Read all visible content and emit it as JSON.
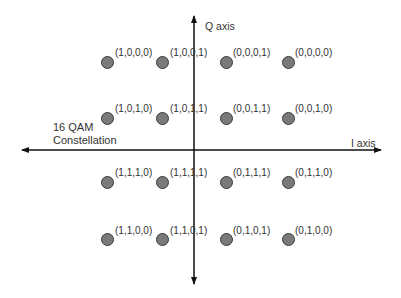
{
  "diagram": {
    "title_line1": "16 QAM",
    "title_line2": "Constellation",
    "q_axis_label": "Q axis",
    "i_axis_label": "I axis",
    "colors": {
      "dot_fill": "#7a7a7a",
      "dot_stroke": "#3a3a3a",
      "axis": "#111111"
    },
    "points": [
      {
        "row": 0,
        "col": 0,
        "label": "(1,0,0,0)"
      },
      {
        "row": 0,
        "col": 1,
        "label": "(1,0,0,1)"
      },
      {
        "row": 0,
        "col": 2,
        "label": "(0,0,0,1)"
      },
      {
        "row": 0,
        "col": 3,
        "label": "(0,0,0,0)"
      },
      {
        "row": 1,
        "col": 0,
        "label": "(1,0,1,0)"
      },
      {
        "row": 1,
        "col": 1,
        "label": "(1,0,1,1)"
      },
      {
        "row": 1,
        "col": 2,
        "label": "(0,0,1,1)"
      },
      {
        "row": 1,
        "col": 3,
        "label": "(0,0,1,0)"
      },
      {
        "row": 2,
        "col": 0,
        "label": "(1,1,1,0)"
      },
      {
        "row": 2,
        "col": 1,
        "label": "(1,1,1,1)"
      },
      {
        "row": 2,
        "col": 2,
        "label": "(0,1,1,1)"
      },
      {
        "row": 2,
        "col": 3,
        "label": "(0,1,1,0)"
      },
      {
        "row": 3,
        "col": 0,
        "label": "(1,1,0,0)"
      },
      {
        "row": 3,
        "col": 1,
        "label": "(1,1,0,1)"
      },
      {
        "row": 3,
        "col": 2,
        "label": "(0,1,0,1)"
      },
      {
        "row": 3,
        "col": 3,
        "label": "(0,1,0,0)"
      }
    ]
  }
}
